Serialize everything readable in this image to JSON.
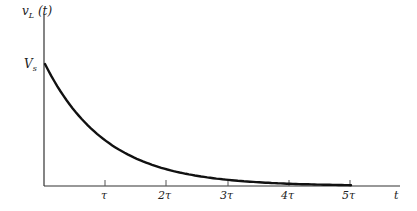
{
  "chart_data": {
    "type": "line",
    "title": "",
    "xlabel": "t",
    "ylabel": "v_L (t)",
    "x_ticks": [
      "τ",
      "2τ",
      "3τ",
      "4τ",
      "5τ"
    ],
    "y_ticks": [
      "V_s"
    ],
    "function": "v_L(t) = V_s * exp(-t/τ)",
    "x": [
      0,
      1,
      2,
      3,
      4,
      5
    ],
    "series": [
      {
        "name": "v_L(t)",
        "values": [
          1.0,
          0.368,
          0.135,
          0.05,
          0.018,
          0.007
        ]
      }
    ],
    "y_units": "fraction of V_s",
    "grid": false,
    "legend": null
  },
  "labels": {
    "y_axis_main": "v",
    "y_axis_sub": "L",
    "y_axis_rest": " (t)",
    "vs_main": "V",
    "vs_sub": "s",
    "x_axis": "t",
    "ticks": [
      "τ",
      "2τ",
      "3τ",
      "4τ",
      "5τ"
    ]
  }
}
